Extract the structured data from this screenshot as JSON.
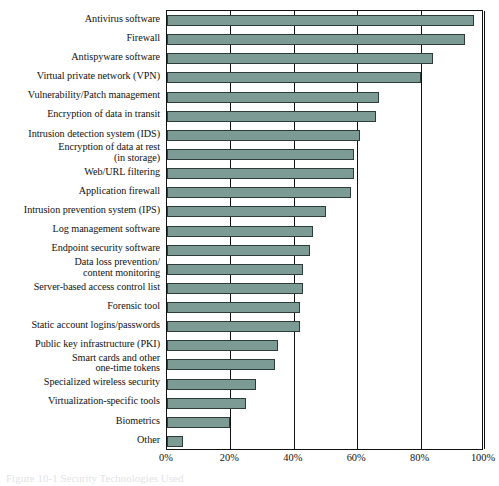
{
  "figure": {
    "caption": "Figure 10-1  Security Technologies Used"
  },
  "axis": {
    "ticks": [
      "0%",
      "20%",
      "40%",
      "60%",
      "80%",
      "100%"
    ]
  },
  "colors": {
    "bar_fill": "#7d9b95",
    "bar_stroke": "#2d3b39",
    "frame": "#111111"
  },
  "chart_data": {
    "type": "bar",
    "orientation": "horizontal",
    "title": "Figure 10-1  Security Technologies Used",
    "xlabel": "",
    "ylabel": "",
    "xlim": [
      0,
      100
    ],
    "xticks": [
      0,
      20,
      40,
      60,
      80,
      100
    ],
    "xtick_labels": [
      "0%",
      "20%",
      "40%",
      "60%",
      "80%",
      "100%"
    ],
    "grid": true,
    "legend": "none",
    "categories": [
      "Antivirus software",
      "Firewall",
      "Antispyware software",
      "Virtual private network (VPN)",
      "Vulnerability/Patch management",
      "Encryption of data in transit",
      "Intrusion detection system (IDS)",
      "Encryption of data at rest\n(in storage)",
      "Web/URL filtering",
      "Application firewall",
      "Intrusion prevention system (IPS)",
      "Log management software",
      "Endpoint security software",
      "Data loss prevention/\ncontent monitoring",
      "Server-based access control list",
      "Forensic tool",
      "Static account logins/passwords",
      "Public key infrastructure (PKI)",
      "Smart cards and other\none-time tokens",
      "Specialized wireless security",
      "Virtualization-specific tools",
      "Biometrics",
      "Other"
    ],
    "values": [
      97,
      94,
      84,
      80,
      67,
      66,
      61,
      59,
      59,
      58,
      50,
      46,
      45,
      43,
      43,
      42,
      42,
      35,
      34,
      28,
      25,
      20,
      5
    ]
  }
}
